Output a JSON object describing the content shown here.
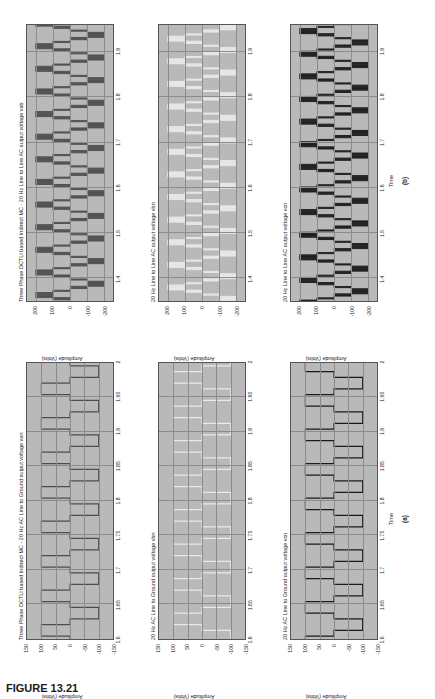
{
  "figure": {
    "caption": "FIGURE 13.21",
    "subfigure_labels": [
      "(a)",
      "(b)"
    ]
  },
  "columns": [
    {
      "id": "a",
      "label": "(a)",
      "xlabel": "Time",
      "ylabel": "Amplitude (Volts)",
      "xticks": [
        "1.6",
        "1.65",
        "1.7",
        "1.75",
        "1.8",
        "1.85",
        "1.9",
        "1.95",
        "2"
      ],
      "xlim": [
        1.6,
        2.0
      ],
      "yticks": [
        "150",
        "100",
        "50",
        "0",
        "-50",
        "-100",
        "-150"
      ],
      "ylim": [
        -150,
        150
      ],
      "panels": [
        {
          "title": "Three Phase DCTLI based Indirect MC - 20 Hz AC Line to Ground output voltage van",
          "trace_color": "#4d4d4d"
        },
        {
          "title": "20 Hz AC Line to Ground output voltage vbn",
          "trace_color": "#eaeaea"
        },
        {
          "title": "20 Hz AC Line to Ground output voltage vcn",
          "trace_color": "#1a1a1a"
        }
      ]
    },
    {
      "id": "b",
      "label": "(b)",
      "xlabel": "Time",
      "ylabel": "Amplitude (Volts)",
      "xticks": [
        "1.4",
        "1.5",
        "1.6",
        "1.7",
        "1.8",
        "1.9"
      ],
      "xlim": [
        1.35,
        1.96
      ],
      "yticks": [
        "200",
        "100",
        "0",
        "-100",
        "-200"
      ],
      "ylim": [
        -250,
        250
      ],
      "panels": [
        {
          "title": "Three Phase DCTLI based Indirect MC - 20 Hz Line to Line AC output voltage vab",
          "trace_color": "#4d4d4d"
        },
        {
          "title": "20 Hz Line to Line AC output voltage vbn",
          "trace_color": "#eaeaea"
        },
        {
          "title": "20 Hz Line to Line AC output voltage vcn",
          "trace_color": "#1a1a1a"
        }
      ]
    }
  ],
  "chart_data": {
    "type": "line",
    "panel_count": 6,
    "grid": true,
    "legend": "none",
    "panels": [
      {
        "panel_id": "a1",
        "title": "Three Phase DCTLI based Indirect MC - 20 Hz AC Line to Ground output voltage van",
        "xlabel": "Time",
        "ylabel": "Amplitude (Volts)",
        "xlim": [
          1.6,
          2.0
        ],
        "ylim": [
          -150,
          150
        ],
        "xticks": [
          1.6,
          1.65,
          1.7,
          1.75,
          1.8,
          1.85,
          1.9,
          1.95,
          2
        ],
        "yticks": [
          150,
          100,
          50,
          0,
          -50,
          -100,
          -150
        ],
        "waveform": "multilevel staircase PWM, 20 Hz fundamental, levels at +100, 0, -100 volts",
        "levels": [
          100,
          0,
          -100
        ],
        "x": [
          1.6,
          1.605,
          1.625,
          1.63,
          1.66,
          1.665,
          1.685,
          1.69,
          1.71,
          1.715,
          1.735,
          1.74,
          1.76,
          1.765,
          1.785,
          1.79,
          1.81,
          1.815,
          1.835,
          1.84,
          1.86,
          1.865,
          1.885,
          1.89,
          1.91,
          1.915,
          1.935,
          1.94,
          1.96,
          1.965,
          1.985,
          1.99,
          2.0
        ],
        "y": [
          -100,
          0,
          0,
          100,
          100,
          0,
          0,
          -100,
          -100,
          0,
          0,
          100,
          100,
          0,
          0,
          -100,
          -100,
          0,
          0,
          100,
          100,
          0,
          0,
          -100,
          -100,
          0,
          0,
          100,
          100,
          0,
          0,
          -100,
          -100
        ]
      },
      {
        "panel_id": "a2",
        "title": "20 Hz AC Line to Ground output voltage vbn",
        "xlabel": "Time",
        "ylabel": "Amplitude (Volts)",
        "xlim": [
          1.6,
          2.0
        ],
        "ylim": [
          -150,
          150
        ],
        "xticks": [
          1.6,
          1.65,
          1.7,
          1.75,
          1.8,
          1.85,
          1.9,
          1.95,
          2
        ],
        "yticks": [
          150,
          100,
          50,
          0,
          -50,
          -100,
          -150
        ],
        "waveform": "multilevel staircase PWM phase b, 120 degrees shifted from van",
        "levels": [
          100,
          0,
          -100
        ]
      },
      {
        "panel_id": "a3",
        "title": "20 Hz AC Line to Ground output voltage vcn",
        "xlabel": "Time",
        "ylabel": "Amplitude (Volts)",
        "xlim": [
          1.6,
          2.0
        ],
        "ylim": [
          -150,
          150
        ],
        "xticks": [
          1.6,
          1.65,
          1.7,
          1.75,
          1.8,
          1.85,
          1.9,
          1.95,
          2
        ],
        "yticks": [
          150,
          100,
          50,
          0,
          -50,
          -100,
          -150
        ],
        "waveform": "multilevel staircase PWM phase c, 240 degrees shifted from van",
        "levels": [
          100,
          0,
          -100
        ]
      },
      {
        "panel_id": "b1",
        "title": "Three Phase DCTLI based Indirect MC - 20 Hz Line to Line AC output voltage vab",
        "xlabel": "Time",
        "ylabel": "Amplitude (Volts)",
        "xlim": [
          1.35,
          1.96
        ],
        "ylim": [
          -250,
          250
        ],
        "xticks": [
          1.4,
          1.5,
          1.6,
          1.7,
          1.8,
          1.9
        ],
        "yticks": [
          200,
          100,
          0,
          -100,
          -200
        ],
        "waveform": "line-to-line multilevel PWM pulse train, levels +200, +100, 0, -100, -200",
        "levels": [
          200,
          100,
          0,
          -100,
          -200
        ]
      },
      {
        "panel_id": "b2",
        "title": "20 Hz Line to Line AC output voltage vbn",
        "xlabel": "Time",
        "ylabel": "Amplitude (Volts)",
        "xlim": [
          1.35,
          1.96
        ],
        "ylim": [
          -250,
          250
        ],
        "xticks": [
          1.4,
          1.5,
          1.6,
          1.7,
          1.8,
          1.9
        ],
        "yticks": [
          200,
          100,
          0,
          -100,
          -200
        ],
        "waveform": "line-to-line multilevel PWM pulse train, phase shifted",
        "levels": [
          200,
          100,
          0,
          -100,
          -200
        ]
      },
      {
        "panel_id": "b3",
        "title": "20 Hz Line to Line AC output voltage vcn",
        "xlabel": "Time",
        "ylabel": "Amplitude (Volts)",
        "xlim": [
          1.35,
          1.96
        ],
        "ylim": [
          -250,
          250
        ],
        "xticks": [
          1.4,
          1.5,
          1.6,
          1.7,
          1.8,
          1.9
        ],
        "yticks": [
          200,
          100,
          0,
          -100,
          -200
        ],
        "waveform": "line-to-line multilevel PWM pulse train, phase shifted",
        "levels": [
          200,
          100,
          0,
          -100,
          -200
        ]
      }
    ]
  }
}
